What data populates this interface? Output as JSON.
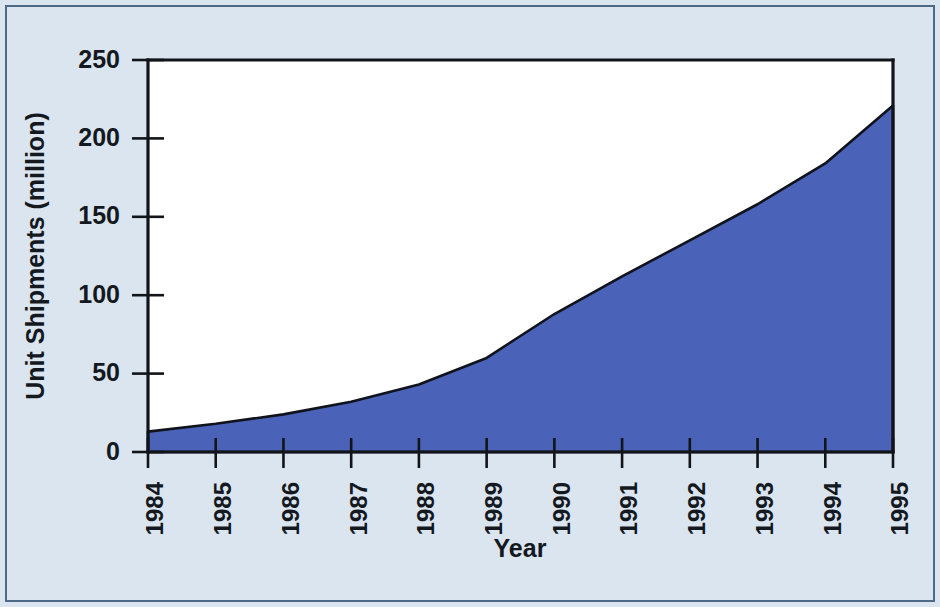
{
  "figure": {
    "background_color": "#dbe5ef",
    "plot_background_color": "#ffffff",
    "border_color": "#4e6a86"
  },
  "chart_data": {
    "type": "area",
    "title": "",
    "subtitle": "",
    "xlabel": "Year",
    "ylabel": "Unit Shipments (million)",
    "categories": [
      "1984",
      "1985",
      "1986",
      "1987",
      "1988",
      "1989",
      "1990",
      "1991",
      "1992",
      "1993",
      "1994",
      "1995"
    ],
    "values": [
      13,
      18,
      24,
      32,
      43,
      60,
      88,
      112,
      135,
      158,
      184,
      221
    ],
    "series": [
      {
        "name": "Unit Shipments",
        "values": [
          13,
          18,
          24,
          32,
          43,
          60,
          88,
          112,
          135,
          158,
          184,
          221
        ],
        "fill_color": "#4a63b8",
        "line_color": "#10131c"
      }
    ],
    "xlim": [
      1984,
      1995
    ],
    "ylim": [
      0,
      250
    ],
    "ytick_labels": [
      "0",
      "50",
      "100",
      "150",
      "200",
      "250"
    ],
    "ytick_values": [
      0,
      50,
      100,
      150,
      200,
      250
    ],
    "xtick_labels": [
      "1984",
      "1985",
      "1986",
      "1987",
      "1988",
      "1989",
      "1990",
      "1991",
      "1992",
      "1993",
      "1994",
      "1995"
    ],
    "xtick_label_rotation": -90,
    "grid": false,
    "legend": false,
    "legend_position": "none",
    "annotations": []
  },
  "axes": {
    "y_title": "Unit Shipments (million)",
    "x_title": "Year",
    "y_ticks": [
      {
        "label": "250",
        "value": 250
      },
      {
        "label": "200",
        "value": 200
      },
      {
        "label": "150",
        "value": 150
      },
      {
        "label": "100",
        "value": 100
      },
      {
        "label": "50",
        "value": 50
      },
      {
        "label": "0",
        "value": 0
      }
    ],
    "x_ticks": [
      {
        "label": "1984"
      },
      {
        "label": "1985"
      },
      {
        "label": "1986"
      },
      {
        "label": "1987"
      },
      {
        "label": "1988"
      },
      {
        "label": "1989"
      },
      {
        "label": "1990"
      },
      {
        "label": "1991"
      },
      {
        "label": "1992"
      },
      {
        "label": "1993"
      },
      {
        "label": "1994"
      },
      {
        "label": "1995"
      }
    ]
  }
}
